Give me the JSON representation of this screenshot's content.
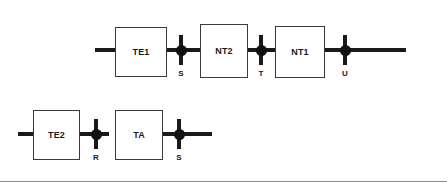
{
  "diagram": {
    "colors": {
      "wire": "#1a1a1a",
      "block_border": "#3a3a3a",
      "block_fill": "#ffffff",
      "node_fill": "#111111",
      "text": "#1a1a1a",
      "rule": "#8e8e8e",
      "background": "#ffffff"
    },
    "rows": [
      {
        "row_name": "upper-chain",
        "blocks": [
          {
            "label": "TE1",
            "x": 115,
            "y": 27,
            "width": 52,
            "height": 50
          },
          {
            "label": "NT2",
            "x": 200,
            "y": 24,
            "width": 48,
            "height": 54
          },
          {
            "label": "NT1",
            "x": 275,
            "y": 26,
            "width": 50,
            "height": 52
          }
        ],
        "nodes": [
          {
            "label": "S",
            "x": 181,
            "y": 52
          },
          {
            "label": "T",
            "x": 261,
            "y": 52
          },
          {
            "label": "U",
            "x": 345,
            "y": 52
          }
        ],
        "wires": [
          {
            "x": 95,
            "y": 50,
            "length": 22
          },
          {
            "x": 166,
            "y": 50,
            "length": 40
          },
          {
            "x": 246,
            "y": 50,
            "length": 32
          },
          {
            "x": 323,
            "y": 50,
            "length": 28
          },
          {
            "x": 344,
            "y": 50,
            "length": 62
          }
        ]
      },
      {
        "row_name": "lower-chain",
        "blocks": [
          {
            "label": "TE2",
            "x": 33,
            "y": 110,
            "width": 47,
            "height": 50
          },
          {
            "label": "TA",
            "x": 115,
            "y": 110,
            "width": 48,
            "height": 50
          }
        ],
        "nodes": [
          {
            "label": "R",
            "x": 96,
            "y": 136
          },
          {
            "label": "S",
            "x": 179,
            "y": 136
          }
        ],
        "wires": [
          {
            "x": 18,
            "y": 134,
            "length": 18
          },
          {
            "x": 79,
            "y": 134,
            "length": 28
          },
          {
            "x": 161,
            "y": 134,
            "length": 28
          },
          {
            "x": 178,
            "y": 134,
            "length": 34
          }
        ]
      }
    ],
    "footer_rule": {
      "y": 181
    }
  }
}
